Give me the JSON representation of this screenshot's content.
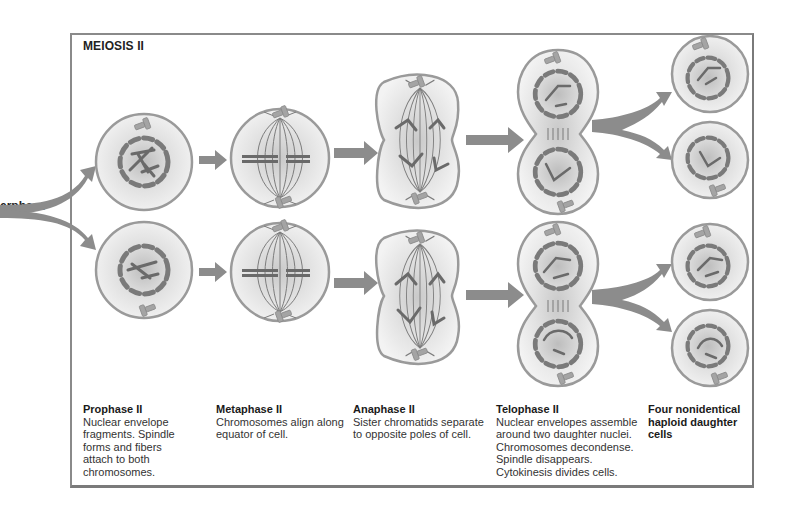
{
  "title": "MEIOSIS II",
  "incoming_label": "erphase",
  "colors": {
    "frame": "#8a8a8a",
    "cell_outline": "#9a9a9a",
    "cell_fill": "#eeeeee",
    "chromosome": "#6e6e6e",
    "arrow": "#8c8c8c",
    "centriole": "#9c9c9c"
  },
  "stages": [
    {
      "id": "prophase-ii",
      "heading": "Prophase II",
      "body": "Nuclear envelope\nfragments. Spindle\nforms and fibers\nattach to both\nchromosomes."
    },
    {
      "id": "metaphase-ii",
      "heading": "Metaphase II",
      "body": "Chromosomes align along\nequator of cell."
    },
    {
      "id": "anaphase-ii",
      "heading": "Anaphase II",
      "body": "Sister chromatids separate\nto opposite poles of cell."
    },
    {
      "id": "telophase-ii",
      "heading": "Telophase II",
      "body": "Nuclear envelopes assemble\naround two daughter nuclei.\nChromosomes decondense.\nSpindle disappears.\nCytokinesis divides cells."
    },
    {
      "id": "daughter-cells",
      "heading": "Four nonidentical\nhaploid daughter\ncells",
      "body": ""
    }
  ],
  "rows": [
    "top",
    "bottom"
  ]
}
